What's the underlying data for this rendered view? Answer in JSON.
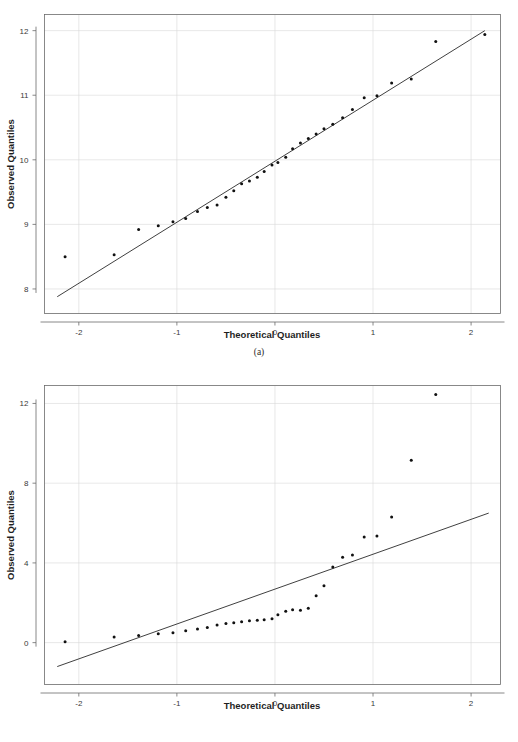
{
  "figure": {
    "panels": [
      {
        "id": "a",
        "caption": "(a)",
        "chart_data": {
          "type": "scatter",
          "title": "",
          "subtitle": "",
          "xlabel": "Theoretical Quantiles",
          "ylabel": "Observed Quantiles",
          "xlim": [
            -2.35,
            2.3
          ],
          "ylim": [
            7.62,
            12.25
          ],
          "xticks": [
            -2,
            -1,
            0,
            1,
            2
          ],
          "xticklabels": [
            "-2",
            "-1",
            "0",
            "1",
            "2"
          ],
          "yticks": [
            8,
            9,
            10,
            11,
            12
          ],
          "yticklabels": [
            "8",
            "9",
            "10",
            "11",
            "12"
          ],
          "grid": true,
          "legend": "none",
          "series": [
            {
              "name": "sample quantiles",
              "marker": "dot",
              "x": [
                -2.14,
                -1.64,
                -1.39,
                -1.19,
                -1.04,
                -0.91,
                -0.79,
                -0.69,
                -0.59,
                -0.5,
                -0.42,
                -0.34,
                -0.26,
                -0.18,
                -0.11,
                -0.03,
                0.03,
                0.11,
                0.18,
                0.26,
                0.34,
                0.42,
                0.5,
                0.59,
                0.69,
                0.79,
                0.91,
                1.04,
                1.19,
                1.39,
                1.64,
                2.14
              ],
              "y": [
                8.5,
                8.53,
                8.92,
                8.98,
                9.04,
                9.09,
                9.2,
                9.26,
                9.3,
                9.42,
                9.52,
                9.63,
                9.67,
                9.73,
                9.82,
                9.92,
                9.96,
                10.04,
                10.17,
                10.26,
                10.33,
                10.4,
                10.48,
                10.55,
                10.65,
                10.78,
                10.96,
                10.99,
                11.19,
                11.25,
                11.83,
                11.94
              ]
            }
          ],
          "reference_line": {
            "name": "qq reference line",
            "x": [
              -2.22,
              2.14
            ],
            "y": [
              7.88,
              12.0
            ]
          }
        }
      },
      {
        "id": "b",
        "caption": "(b)",
        "chart_data": {
          "type": "scatter",
          "title": "",
          "subtitle": "",
          "xlabel": "Theoretical Quantiles",
          "ylabel": "Observed Quantiles",
          "xlim": [
            -2.35,
            2.3
          ],
          "ylim": [
            -2.1,
            12.9
          ],
          "xticks": [
            -2,
            -1,
            0,
            1,
            2
          ],
          "xticklabels": [
            "-2",
            "-1",
            "0",
            "1",
            "2"
          ],
          "yticks": [
            0,
            4,
            8,
            12
          ],
          "yticklabels": [
            "0",
            "4",
            "8",
            "12"
          ],
          "grid": true,
          "legend": "none",
          "series": [
            {
              "name": "sample quantiles",
              "marker": "dot",
              "x": [
                -2.14,
                -1.64,
                -1.39,
                -1.19,
                -1.04,
                -0.91,
                -0.79,
                -0.69,
                -0.59,
                -0.5,
                -0.42,
                -0.34,
                -0.26,
                -0.18,
                -0.11,
                -0.03,
                0.03,
                0.11,
                0.18,
                0.26,
                0.34,
                0.42,
                0.5,
                0.59,
                0.69,
                0.79,
                0.91,
                1.04,
                1.19,
                1.39,
                1.64,
                2.14
              ],
              "y": [
                0.05,
                0.28,
                0.36,
                0.45,
                0.5,
                0.6,
                0.68,
                0.76,
                0.88,
                0.96,
                1.0,
                1.05,
                1.1,
                1.12,
                1.15,
                1.2,
                1.4,
                1.58,
                1.65,
                1.62,
                1.72,
                2.35,
                2.85,
                3.8,
                4.28,
                4.4,
                5.3,
                5.35,
                6.3,
                9.15,
                12.45
              ],
              "note": "one point shares a theoretical quantile slot; 32 theoretical values, 31 observed plotted"
            }
          ],
          "reference_line": {
            "name": "qq reference line",
            "x": [
              -2.22,
              2.18
            ],
            "y": [
              -1.2,
              6.5
            ]
          }
        }
      }
    ]
  }
}
